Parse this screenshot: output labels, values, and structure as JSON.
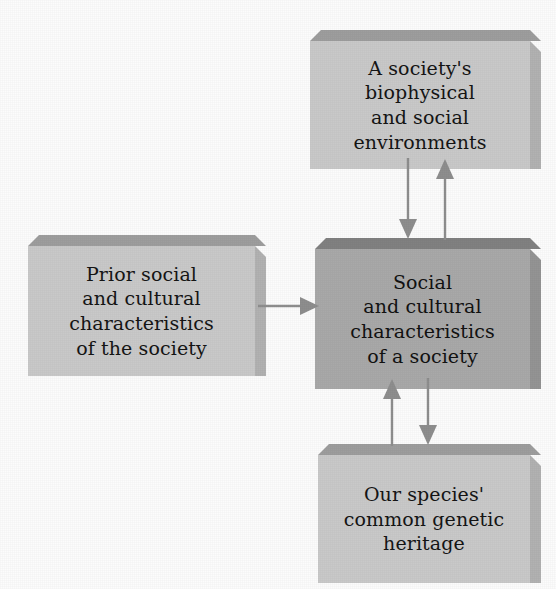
{
  "diagram": {
    "background_color": "#fcfcfc",
    "boxes": [
      {
        "id": "biophysical-social-environments",
        "name": "environments-box",
        "text": "A society's\nbiophysical\nand social\nenvironments",
        "fill_color": "#c9c9c9",
        "top_face_color": "#9e9e9e",
        "side_face_color": "#b2b2b2",
        "text_color": "#151515",
        "font_size_px": 19,
        "x": 310,
        "y": 30,
        "width": 220,
        "height": 128,
        "depth": 11
      },
      {
        "id": "prior-social-cultural-characteristics",
        "name": "prior-characteristics-box",
        "text": "Prior social\nand cultural\ncharacteristics\nof the society",
        "fill_color": "#c9c9c9",
        "top_face_color": "#9e9e9e",
        "side_face_color": "#b2b2b2",
        "text_color": "#151515",
        "font_size_px": 19,
        "x": 28,
        "y": 235,
        "width": 227,
        "height": 130,
        "depth": 11
      },
      {
        "id": "social-cultural-characteristics",
        "name": "central-characteristics-box",
        "text": "Social\nand cultural\ncharacteristics\nof a society",
        "fill_color": "#a9a9a9",
        "top_face_color": "#818181",
        "side_face_color": "#949494",
        "text_color": "#121212",
        "font_size_px": 19,
        "x": 315,
        "y": 238,
        "width": 215,
        "height": 140,
        "depth": 11
      },
      {
        "id": "common-genetic-heritage",
        "name": "genetic-heritage-box",
        "text": "Our species'\ncommon genetic\nheritage",
        "fill_color": "#c9c9c9",
        "top_face_color": "#9e9e9e",
        "side_face_color": "#b2b2b2",
        "text_color": "#151515",
        "font_size_px": 19,
        "x": 318,
        "y": 444,
        "width": 212,
        "height": 128,
        "depth": 11
      }
    ],
    "arrows": [
      {
        "id": "prior-to-central",
        "name": "arrow-prior-to-central",
        "from": "prior-social-cultural-characteristics",
        "to": "social-cultural-characteristics",
        "direction": "right",
        "color": "#8e8e8e"
      },
      {
        "id": "environments-to-central",
        "name": "arrow-environments-to-central",
        "from": "biophysical-social-environments",
        "to": "social-cultural-characteristics",
        "direction": "down",
        "color": "#8e8e8e"
      },
      {
        "id": "central-to-environments",
        "name": "arrow-central-to-environments",
        "from": "social-cultural-characteristics",
        "to": "biophysical-social-environments",
        "direction": "up",
        "color": "#8e8e8e"
      },
      {
        "id": "heritage-to-central",
        "name": "arrow-heritage-to-central",
        "from": "common-genetic-heritage",
        "to": "social-cultural-characteristics",
        "direction": "up",
        "color": "#8e8e8e"
      },
      {
        "id": "central-to-heritage",
        "name": "arrow-central-to-heritage",
        "from": "social-cultural-characteristics",
        "to": "common-genetic-heritage",
        "direction": "down",
        "color": "#8e8e8e"
      }
    ]
  }
}
